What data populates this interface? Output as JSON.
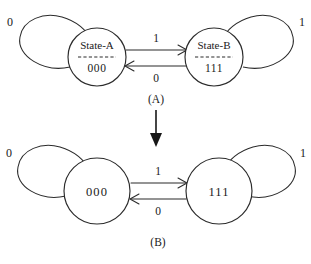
{
  "figure": {
    "background_color": "#ffffff",
    "stroke_color": "#2b2b2b",
    "text_color": "#1a1a1a"
  },
  "diagram_a": {
    "caption": "(A)",
    "left_node": {
      "title": "State-A",
      "code": "000"
    },
    "right_node": {
      "title": "State-B",
      "code": "111"
    },
    "self_loop_left_label": "0",
    "self_loop_right_label": "1",
    "transition_forward_label": "1",
    "transition_back_label": "0"
  },
  "diagram_b": {
    "caption": "(B)",
    "left_node": {
      "code": "000"
    },
    "right_node": {
      "code": "111"
    },
    "self_loop_left_label": "0",
    "self_loop_right_label": "1",
    "transition_forward_label": "1",
    "transition_back_label": "0"
  },
  "refinement_arrow": {
    "direction": "down"
  }
}
